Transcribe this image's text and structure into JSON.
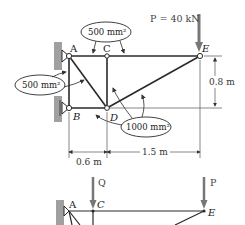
{
  "diagram": {
    "top_truss": {
      "load": {
        "label": "P = 40 kN"
      },
      "joints": {
        "A": "A",
        "B": "B",
        "C": "C",
        "D": "D",
        "E": "E"
      },
      "areas": {
        "top": "500 mm²",
        "left": "500 mm²",
        "diag": "1000 mm²"
      },
      "dimensions": {
        "height": "0.8 m",
        "span1": "0.6 m",
        "span2": "1.5 m"
      }
    },
    "bottom_truss": {
      "loads": {
        "Q": "Q",
        "P": "P"
      },
      "joints": {
        "A": "A",
        "C": "C",
        "E": "E"
      }
    }
  },
  "colors": {
    "member": "#2a2a2a",
    "wall": "#9a9a9a",
    "arrow": "#777777",
    "dimline": "#555555"
  }
}
